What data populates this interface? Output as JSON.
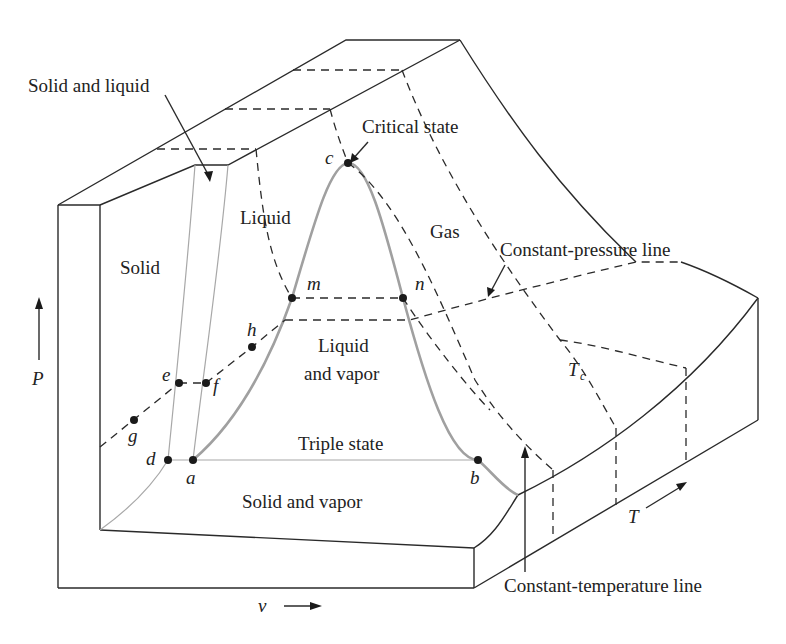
{
  "diagram": {
    "type": "P-v-T surface (3D thermodynamic surface)",
    "axes": {
      "pressure": {
        "label": "P",
        "direction": "up"
      },
      "specific_volume": {
        "label": "v",
        "direction": "right"
      },
      "temperature": {
        "label": "T",
        "direction": "into page (diagonal up-right)"
      }
    },
    "regions": {
      "solid": "Solid",
      "solid_liquid": "Solid and liquid",
      "liquid": "Liquid",
      "gas": "Gas",
      "liquid_vapor_1": "Liquid",
      "liquid_vapor_2": "and vapor",
      "solid_vapor": "Solid and vapor"
    },
    "annotations": {
      "critical_state": "Critical state",
      "triple_state": "Triple state",
      "constant_pressure_line": "Constant-pressure line",
      "constant_temperature_line": "Constant-temperature line",
      "critical_temperature": "T",
      "critical_temperature_sub": "c"
    },
    "points": {
      "a": "a",
      "b": "b",
      "c": "c",
      "d": "d",
      "e": "e",
      "f": "f",
      "g": "g",
      "h": "h",
      "m": "m",
      "n": "n"
    }
  }
}
